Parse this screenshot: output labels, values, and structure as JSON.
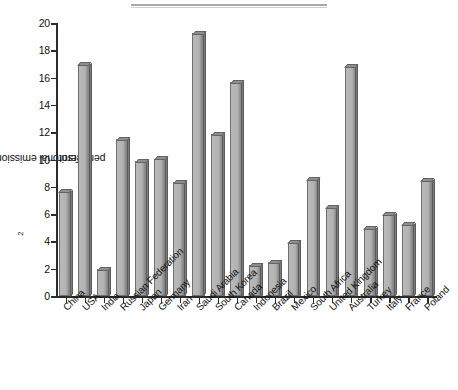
{
  "chart_data": {
    "type": "bar",
    "title": "",
    "xlabel": "",
    "ylabel": "Territorial emissions in tonnes CO2 per person",
    "ylabel_prefix": "Territorial emissions in tonnes CO",
    "ylabel_sub": "2",
    "ylabel_suffix": " per person",
    "ylim": [
      0,
      20
    ],
    "ytick_labels": [
      "0",
      "2",
      "4",
      "6",
      "8",
      "10",
      "12",
      "14",
      "16",
      "18",
      "20"
    ],
    "ytick_values": [
      0,
      2,
      4,
      6,
      8,
      10,
      12,
      14,
      16,
      18,
      20
    ],
    "grid": false,
    "legend": "none",
    "categories": [
      "China",
      "USA",
      "India",
      "Russian Federation",
      "Japan",
      "Germany",
      "Iran",
      "Saudi Arabia",
      "South Korea",
      "Canada",
      "Indonesia",
      "Brazil",
      "Mexico",
      "South Africa",
      "United Kingdom",
      "Australia",
      "Turkey",
      "Italy",
      "France",
      "Poland"
    ],
    "values": [
      7.6,
      16.9,
      1.9,
      11.4,
      9.8,
      10.0,
      8.3,
      19.2,
      11.8,
      15.6,
      2.2,
      2.4,
      3.9,
      8.5,
      6.4,
      16.8,
      4.9,
      5.9,
      5.2,
      8.4
    ]
  },
  "style": {
    "bar_face_color": "#b5b5b5",
    "bar_shadow_color": "#7b7b7b",
    "axis_color": "#2b2b2b",
    "text_color": "#111111",
    "background": "#ffffff"
  }
}
